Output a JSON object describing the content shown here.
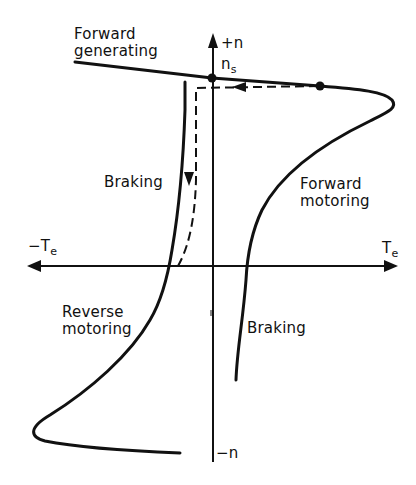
{
  "diagram": {
    "axes": {
      "vertical_pos_label": "+n",
      "vertical_neg_label": "−n",
      "horizontal_pos_label": "T",
      "horizontal_pos_sub": "e",
      "horizontal_neg_label": "−T",
      "horizontal_neg_sub": "e",
      "sync_speed_label": "n",
      "sync_speed_sub": "s"
    },
    "regions": {
      "forward_generating_line1": "Forward",
      "forward_generating_line2": "generating",
      "braking_upper": "Braking",
      "forward_motoring_line1": "Forward",
      "forward_motoring_line2": "motoring",
      "reverse_motoring_line1": "Reverse",
      "reverse_motoring_line2": "motoring",
      "braking_lower": "Braking"
    },
    "colors": {
      "ink": "#111111",
      "background": "#ffffff"
    }
  }
}
